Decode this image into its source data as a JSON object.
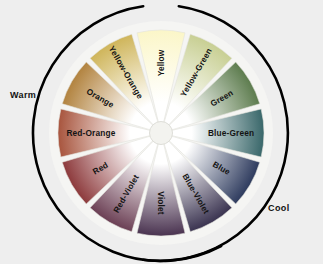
{
  "figure": {
    "name": "color-wheel",
    "background_color": "#eeeeee",
    "disc_color": "#f4f4f2",
    "center": {
      "x": 161,
      "y": 133
    },
    "outer_radius": 103,
    "inner_radius": 11,
    "hub_color": "#f3f3ef"
  },
  "temperature_labels": {
    "warm": "Warm",
    "cool": "Cool"
  },
  "arcs": {
    "warm_color": "#000000",
    "cool_color": "#000000",
    "warm_start_deg": -8,
    "warm_end_deg": 208,
    "cool_start_deg": 8,
    "cool_end_deg": -172
  },
  "chart_data": {
    "type": "pie",
    "legend": "none",
    "categories": [
      "Yellow",
      "Yellow-Green",
      "Green",
      "Blue-Green",
      "Blue",
      "Blue-Violet",
      "Violet",
      "Red-Violet",
      "Red",
      "Red-Orange",
      "Orange",
      "Yellow-Orange"
    ],
    "values": [
      30,
      30,
      30,
      30,
      30,
      30,
      30,
      30,
      30,
      30,
      30,
      30
    ],
    "segment_count": 12,
    "segment_degrees": 30,
    "colors": [
      "#fbf6c8",
      "#c8cf93",
      "#5d7c4e",
      "#39676a",
      "#2e3b5e",
      "#3a3350",
      "#4a3350",
      "#6b3f54",
      "#8d3a3c",
      "#a8553e",
      "#b2833f",
      "#cfb55a"
    ],
    "segments": [
      {
        "label": "Yellow",
        "index": 0,
        "angle_deg": 0,
        "color": "#fbf6c8",
        "text_color": "#141414"
      },
      {
        "label": "Yellow-Green",
        "index": 1,
        "angle_deg": 30,
        "color": "#c8cf93",
        "text_color": "#141414"
      },
      {
        "label": "Green",
        "index": 2,
        "angle_deg": 60,
        "color": "#5d7c4e",
        "text_color": "#141414"
      },
      {
        "label": "Blue-Green",
        "index": 3,
        "angle_deg": 90,
        "color": "#39676a",
        "text_color": "#141414"
      },
      {
        "label": "Blue",
        "index": 4,
        "angle_deg": 120,
        "color": "#2e3b5e",
        "text_color": "#141414"
      },
      {
        "label": "Blue-Violet",
        "index": 5,
        "angle_deg": 150,
        "color": "#3a3350",
        "text_color": "#141414"
      },
      {
        "label": "Violet",
        "index": 6,
        "angle_deg": 180,
        "color": "#4a3350",
        "text_color": "#141414"
      },
      {
        "label": "Red-Violet",
        "index": 7,
        "angle_deg": 210,
        "color": "#6b3f54",
        "text_color": "#141414"
      },
      {
        "label": "Red",
        "index": 8,
        "angle_deg": 240,
        "color": "#8d3a3c",
        "text_color": "#141414"
      },
      {
        "label": "Red-Orange",
        "index": 9,
        "angle_deg": 270,
        "color": "#a8553e",
        "text_color": "#141414"
      },
      {
        "label": "Orange",
        "index": 10,
        "angle_deg": 300,
        "color": "#b2833f",
        "text_color": "#141414"
      },
      {
        "label": "Yellow-Orange",
        "index": 11,
        "angle_deg": 330,
        "color": "#cfb55a",
        "text_color": "#141414"
      }
    ]
  }
}
